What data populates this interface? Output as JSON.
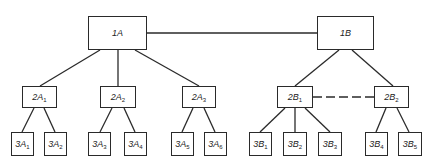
{
  "diagram": {
    "type": "hierarchy",
    "colors": {
      "line": "#2a2a2a",
      "background": "#ffffff"
    },
    "nodes": {
      "1A": {
        "main": "1A",
        "sub": ""
      },
      "1B": {
        "main": "1B",
        "sub": ""
      },
      "2A1": {
        "main": "2A",
        "sub": "1"
      },
      "2A2": {
        "main": "2A",
        "sub": "2"
      },
      "2A3": {
        "main": "2A",
        "sub": "3"
      },
      "2B1": {
        "main": "2B",
        "sub": "1"
      },
      "2B2": {
        "main": "2B",
        "sub": "2"
      },
      "3A1": {
        "main": "3A",
        "sub": "1"
      },
      "3A2": {
        "main": "3A",
        "sub": "2"
      },
      "3A3": {
        "main": "3A",
        "sub": "3"
      },
      "3A4": {
        "main": "3A",
        "sub": "4"
      },
      "3A5": {
        "main": "3A",
        "sub": "5"
      },
      "3A6": {
        "main": "3A",
        "sub": "6"
      },
      "3B1": {
        "main": "3B",
        "sub": "1"
      },
      "3B2": {
        "main": "3B",
        "sub": "2"
      },
      "3B3": {
        "main": "3B",
        "sub": "3"
      },
      "3B4": {
        "main": "3B",
        "sub": "4"
      },
      "3B5": {
        "main": "3B",
        "sub": "5"
      }
    },
    "edges": [
      {
        "from": "1A",
        "to": "1B",
        "style": "solid"
      },
      {
        "from": "1A",
        "to": "2A1",
        "style": "solid"
      },
      {
        "from": "1A",
        "to": "2A2",
        "style": "solid"
      },
      {
        "from": "1A",
        "to": "2A3",
        "style": "solid"
      },
      {
        "from": "1B",
        "to": "2B1",
        "style": "solid"
      },
      {
        "from": "1B",
        "to": "2B2",
        "style": "solid"
      },
      {
        "from": "2B1",
        "to": "2B2",
        "style": "dashed"
      },
      {
        "from": "2A1",
        "to": "3A1",
        "style": "solid"
      },
      {
        "from": "2A1",
        "to": "3A2",
        "style": "solid"
      },
      {
        "from": "2A2",
        "to": "3A3",
        "style": "solid"
      },
      {
        "from": "2A2",
        "to": "3A4",
        "style": "solid"
      },
      {
        "from": "2A3",
        "to": "3A5",
        "style": "solid"
      },
      {
        "from": "2A3",
        "to": "3A6",
        "style": "solid"
      },
      {
        "from": "2B1",
        "to": "3B1",
        "style": "solid"
      },
      {
        "from": "2B1",
        "to": "3B2",
        "style": "solid"
      },
      {
        "from": "2B1",
        "to": "3B3",
        "style": "solid"
      },
      {
        "from": "2B2",
        "to": "3B4",
        "style": "solid"
      },
      {
        "from": "2B2",
        "to": "3B5",
        "style": "solid"
      }
    ]
  }
}
